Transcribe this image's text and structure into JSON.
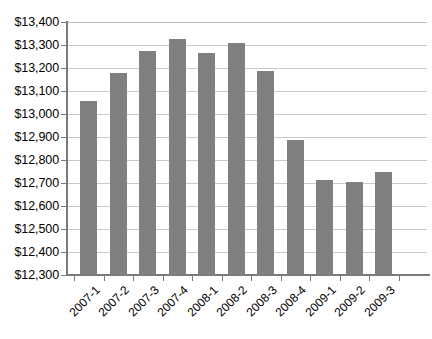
{
  "chart_data": {
    "type": "bar",
    "title": "",
    "subtitle": "",
    "xlabel": "",
    "ylabel": "",
    "categories": [
      "2007-1",
      "2007-2",
      "2007-3",
      "2007-4",
      "2008-1",
      "2008-2",
      "2008-3",
      "2008-4",
      "2009-1",
      "2009-2",
      "2009-3"
    ],
    "values": [
      13055,
      13177,
      13272,
      13325,
      13267,
      13310,
      13188,
      12885,
      12713,
      12705,
      12750
    ],
    "series": [
      {
        "name": "",
        "values": [
          13055,
          13177,
          13272,
          13325,
          13267,
          13310,
          13188,
          12885,
          12713,
          12705,
          12750
        ]
      }
    ],
    "ylim": [
      12300,
      13400
    ],
    "ytick_values": [
      12300,
      12400,
      12500,
      12600,
      12700,
      12800,
      12900,
      13000,
      13100,
      13200,
      13300,
      13400
    ],
    "ytick_labels": [
      "$12,300",
      "$12,400",
      "$12,500",
      "$12,600",
      "$12,700",
      "$12,800",
      "$12,900",
      "$13,000",
      "$13,100",
      "$13,200",
      "$13,300",
      "$13,400"
    ],
    "grid": true,
    "grid_axis": "y",
    "legend": false,
    "legend_position": "none",
    "bar_color": "#808080",
    "gridline_color": "#c9c9c9",
    "axis_color": "#7a7a7a",
    "background_color": "#ffffff",
    "xtick_label_rotation": -45,
    "annotations": []
  }
}
